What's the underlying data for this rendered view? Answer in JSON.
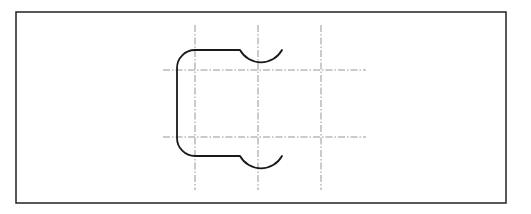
{
  "diagram": {
    "type": "technical-drawing",
    "colors": {
      "background": "#ffffff",
      "frame": "#222222",
      "profile": "#1a1a1a",
      "centerline": "#8a8a8a"
    },
    "frame": {
      "x": 16,
      "y": 12,
      "width": 490,
      "height": 191
    },
    "centerlines": {
      "vertical": [
        {
          "x": 195,
          "y1": 25,
          "y2": 190
        },
        {
          "x": 258,
          "y1": 25,
          "y2": 190
        },
        {
          "x": 321,
          "y1": 25,
          "y2": 190
        }
      ],
      "horizontal": [
        {
          "y": 70,
          "x1": 163,
          "x2": 366
        },
        {
          "y": 137,
          "x1": 163,
          "x2": 366
        }
      ]
    },
    "profile_path": "M 282 50 A 24 24 0 0 1 240 50 L 195 50 A 18 18 0 0 0 177 68 L 177 138 A 18 18 0 0 0 195 156 L 240 156 A 24 24 0 0 0 282 156"
  }
}
